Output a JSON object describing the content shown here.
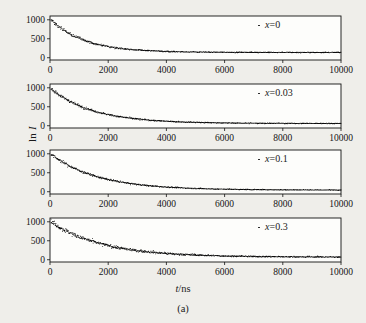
{
  "figure": {
    "caption": "(a)",
    "xlabel_italic": "t",
    "xlabel_rest": "/ns",
    "ylabel_prefix": "ln ",
    "ylabel_italic": "I"
  },
  "chart_data": {
    "type": "scatter",
    "title": "",
    "subtitle": "",
    "caption": "(a)",
    "xlabel": "t/ns",
    "ylabel": "ln I",
    "xlim": [
      0,
      10000
    ],
    "ylim": [
      -60,
      1100
    ],
    "xticks": [
      0,
      2000,
      4000,
      6000,
      8000,
      10000
    ],
    "xtick_labels": [
      "0",
      "2000",
      "4000",
      "6000",
      "8000",
      "10000"
    ],
    "yticks": [
      0,
      500,
      1000
    ],
    "ytick_labels": [
      "0",
      "500",
      "1000"
    ],
    "grid": false,
    "legend_position": "upper right",
    "marker": "dot",
    "marker_color": "#0b0b0b",
    "panels": [
      {
        "id": "panel-x0",
        "legend": "x=0",
        "legend_var": "x",
        "legend_value": "0",
        "amplitude": 880,
        "baseline": 150,
        "tau": 1150,
        "noise": 26,
        "n_points": 430
      },
      {
        "id": "panel-x003",
        "legend": "x=0.03",
        "legend_var": "x",
        "legend_value": "0.03",
        "amplitude": 930,
        "baseline": 70,
        "tau": 1450,
        "noise": 24,
        "n_points": 430
      },
      {
        "id": "panel-x01",
        "legend": "x=0.1",
        "legend_var": "x",
        "legend_value": "0.1",
        "amplitude": 960,
        "baseline": 55,
        "tau": 1600,
        "noise": 22,
        "n_points": 430
      },
      {
        "id": "panel-x03",
        "legend": "x=0.3",
        "legend_var": "x",
        "legend_value": "0.3",
        "amplitude": 945,
        "baseline": 80,
        "tau": 1750,
        "noise": 38,
        "n_points": 430
      }
    ]
  }
}
